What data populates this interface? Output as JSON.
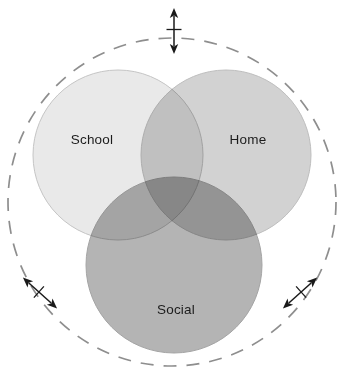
{
  "diagram": {
    "type": "venn",
    "background_color": "#ffffff",
    "canvas": {
      "width": 341,
      "height": 373
    },
    "boundary": {
      "name": "dashed-context-circle",
      "style": "dashed",
      "color": "#8e8e8e",
      "center_x": 172,
      "center_y": 202,
      "radius": 164,
      "dash_length": 13,
      "gap_length": 10,
      "stroke_width": 1.7
    },
    "sets": [
      {
        "id": "school",
        "label": "School",
        "fill": "#e9e9e9",
        "stroke": "#c4c4c4",
        "center_x": 118,
        "center_y": 155,
        "radius": 85,
        "label_x": 92,
        "label_y": 140
      },
      {
        "id": "home",
        "label": "Home",
        "fill": "#d2d2d2",
        "stroke": "#bdbdbd",
        "center_x": 226,
        "center_y": 155,
        "radius": 85,
        "label_x": 248,
        "label_y": 140
      },
      {
        "id": "social",
        "label": "Social",
        "fill": "#b4b4b4",
        "stroke": "#a4a4a4",
        "center_x": 174,
        "center_y": 265,
        "radius": 88,
        "label_x": 176,
        "label_y": 310
      }
    ],
    "overlap_colors": {
      "school_home": "#c0c0c0",
      "school_social": "#9a9a9a",
      "home_social": "#949494",
      "all_three": "#808080"
    },
    "arrows": [
      {
        "id": "arrow-top",
        "name": "double-arrow-vertical",
        "orientation": "vertical",
        "direction": "double-headed",
        "has_crossbar": true,
        "color": "#1a1a1a",
        "center_x": 174,
        "center_y": 31,
        "length": 46,
        "angle_deg": 90
      },
      {
        "id": "arrow-bottom-left",
        "name": "double-arrow-diagonal-left",
        "orientation": "diagonal",
        "direction": "double-headed",
        "has_crossbar": true,
        "color": "#1a1a1a",
        "center_x": 40,
        "center_y": 293,
        "length": 46,
        "angle_deg": 138
      },
      {
        "id": "arrow-bottom-right",
        "name": "double-arrow-diagonal-right",
        "orientation": "diagonal",
        "direction": "double-headed",
        "has_crossbar": true,
        "color": "#1a1a1a",
        "center_x": 300,
        "center_y": 293,
        "length": 46,
        "angle_deg": 42
      }
    ]
  }
}
